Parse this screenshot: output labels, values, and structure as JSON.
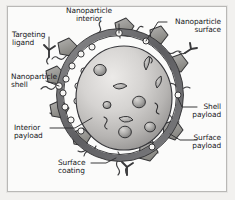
{
  "figure": {
    "background_color": "#fbfbfa",
    "border_color": "#b9b8b6",
    "outer_margin_color": "#f2f1ef"
  },
  "palette": {
    "shell_ring": "#6e6e70",
    "core_light": "#e2e1df",
    "core_mid": "#b9b8b6",
    "core_dark": "#8d8c8b",
    "ligand_fill": "#9a9998",
    "outline": "#3a3a3c",
    "payload_fill": "#9f9e9d",
    "shell_payload_fill": "#f4f3f1",
    "text": "#17181a",
    "leader_line": "#3a3a3c"
  },
  "labels": [
    {
      "id": "targeting-ligand",
      "text": "Targeting\nligand",
      "align": "left",
      "x": 12,
      "y": 31
    },
    {
      "id": "nanoparticle-interior",
      "text": "Nanoparticle\ninterior",
      "align": "center",
      "x": 88,
      "y": 7
    },
    {
      "id": "nanoparticle-surface",
      "text": "Nanoparticle\nsurface",
      "align": "right",
      "x": 169,
      "y": 18
    },
    {
      "id": "nanoparticle-shell",
      "text": "Nanoparticle\nshell",
      "align": "left",
      "x": 11,
      "y": 73
    },
    {
      "id": "interior-payload",
      "text": "Interior\npayload",
      "align": "left",
      "x": 14,
      "y": 124
    },
    {
      "id": "surface-coating",
      "text": "Surface\ncoating",
      "align": "left",
      "x": 58,
      "y": 159
    },
    {
      "id": "shell-payload",
      "text": "Shell\npayload",
      "align": "right",
      "x": 199,
      "y": 103
    },
    {
      "id": "surface-payload",
      "text": "Surface\npayload",
      "align": "right",
      "x": 199,
      "y": 134
    }
  ],
  "components": {
    "core": "nanoparticle interior core sphere with shaded payloads",
    "shell": "dark ring surrounding the core representing the nanoparticle shell",
    "shell_payloads": "small open circles embedded in the shell ring",
    "interior_payloads": "lens and sphere shapes inside the core",
    "surface_payloads": "pentagon shapes attached on the outer surface",
    "surface_coating": "wavy polymer chains projecting from the surface",
    "targeting_ligands": "Y-shaped antibody structures on tethers"
  }
}
